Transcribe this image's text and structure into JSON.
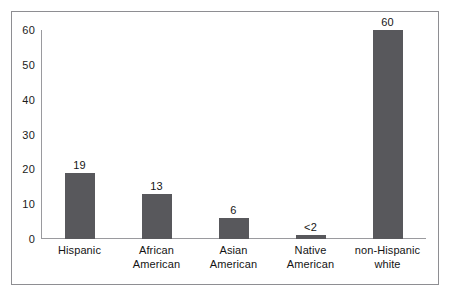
{
  "chart_data": {
    "type": "bar",
    "title": "",
    "subtitle": "",
    "xlabel": "",
    "ylabel": "",
    "ylim": [
      0,
      60
    ],
    "yticks": [
      0,
      10,
      20,
      30,
      40,
      50,
      60
    ],
    "grid": false,
    "legend": null,
    "bar_color": "#58585c",
    "frame_color": "#8e8e92",
    "axis_color": "#9a9a9e",
    "categories": [
      "Hispanic",
      "African American",
      "Asian American",
      "Native American",
      "non-Hispanic white"
    ],
    "category_lines": [
      [
        "Hispanic"
      ],
      [
        "African",
        "American"
      ],
      [
        "Asian",
        "American"
      ],
      [
        "Native",
        "American"
      ],
      [
        "non-Hispanic",
        "white"
      ]
    ],
    "values": [
      19,
      13,
      6,
      1.2,
      60
    ],
    "data_labels": [
      "19",
      "13",
      "6",
      "<2",
      "60"
    ]
  }
}
